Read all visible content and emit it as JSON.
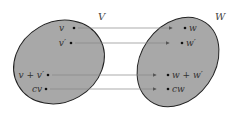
{
  "diagram": {
    "domain_set": {
      "label": "V",
      "fill": "#a8a8a8",
      "stroke": "#222222"
    },
    "codomain_set": {
      "label": "W",
      "fill": "#a8a8a8",
      "stroke": "#222222"
    },
    "mappings": [
      {
        "from": "v",
        "to": "w"
      },
      {
        "from": "v′",
        "to": "w′"
      },
      {
        "from": "v + v′",
        "to": "w + w′"
      },
      {
        "from": "cv",
        "to": "cw"
      }
    ],
    "arrow_color": "#777777"
  }
}
